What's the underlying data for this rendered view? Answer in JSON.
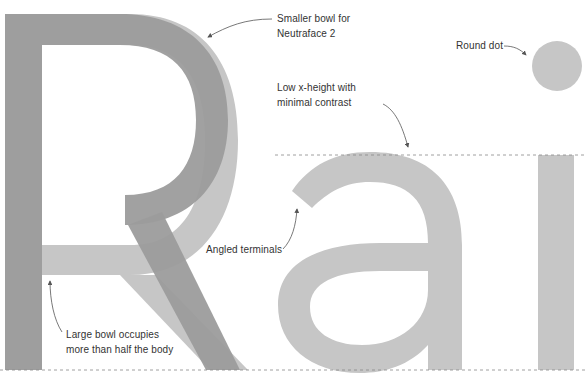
{
  "diagram": {
    "glyphs": "Rai",
    "colors": {
      "dark_glyph": "#9c9c9c",
      "light_glyph": "#c6c6c6",
      "annotation_text": "#333333",
      "arrow": "#555555",
      "guide_line": "#888888",
      "background": "#ffffff"
    },
    "guides": {
      "x_height_line": "dashed",
      "baseline": "dashed"
    },
    "annotations": [
      {
        "id": "smaller-bowl",
        "lines": [
          "Smaller bowl for",
          "Neutraface 2"
        ]
      },
      {
        "id": "round-dot",
        "lines": [
          "Round dot"
        ]
      },
      {
        "id": "low-x-height",
        "lines": [
          "Low x-height with",
          "minimal contrast"
        ]
      },
      {
        "id": "angled-terminals",
        "lines": [
          "Angled terminals"
        ]
      },
      {
        "id": "large-bowl",
        "lines": [
          "Large bowl occupies",
          "more than half the body"
        ]
      }
    ]
  }
}
